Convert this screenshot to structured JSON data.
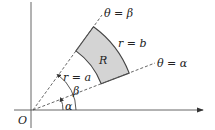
{
  "diagram": {
    "type": "polar-region",
    "origin_label": "O",
    "region_label": "R",
    "inner_boundary_label": "r = a",
    "outer_boundary_label": "r = b",
    "ray_alpha_label": "θ = α",
    "ray_beta_label": "θ = β",
    "angle_alpha_label": "α",
    "angle_beta_label": "β",
    "colors": {
      "region_fill": "#d4d4d4",
      "stroke": "#444444",
      "dashed": "#555555"
    }
  }
}
